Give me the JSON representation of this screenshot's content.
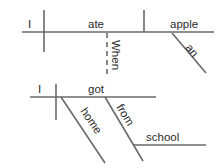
{
  "document": {
    "type": "reed-kellogg-sentence-diagram",
    "background_color": "#ffffff",
    "line_color": "#6a6a6a",
    "text_color": "#2b2b2b"
  },
  "diagrams": [
    {
      "id": "diagram-upper",
      "sentence": "When I ate an apple",
      "words": {
        "subject": "I",
        "verb": "ate",
        "object": "apple",
        "article": "an",
        "subordinator": "When"
      }
    },
    {
      "id": "diagram-lower",
      "sentence": "I got home from school",
      "words": {
        "subject": "I",
        "verb": "got",
        "adverb": "home",
        "preposition": "from",
        "object_of_preposition": "school"
      }
    }
  ]
}
